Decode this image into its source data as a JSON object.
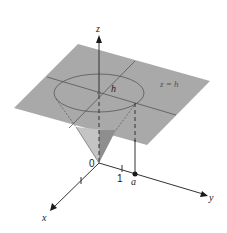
{
  "figure": {
    "colors": {
      "plane": "#a9a9a9",
      "cone_light": "#c4c4c4",
      "cone_dark": "#8e8e8e",
      "line": "#333333",
      "plane_line": "#555555"
    },
    "axes": {
      "x_label": "x",
      "y_label": "y",
      "z_label": "z",
      "origin_label": "0"
    },
    "ticks": {
      "y_one_label": "1",
      "y_a_label": "a"
    },
    "labels": {
      "height_label": "h",
      "plane_label": "z = h"
    }
  }
}
